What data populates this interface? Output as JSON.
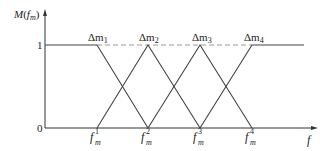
{
  "diagram": {
    "type": "membership-functions",
    "y_axis_label": {
      "main": "M(",
      "var": "f",
      "sub": "m",
      "close": ")"
    },
    "x_axis_label": "f",
    "y_ticks": [
      "1",
      "0"
    ],
    "peaks": [
      {
        "label": "Δm",
        "sub": "1",
        "x_label": "f",
        "x_sub": "m",
        "x_sup": "1"
      },
      {
        "label": "Δm",
        "sub": "2",
        "x_label": "f",
        "x_sub": "m",
        "x_sup": "2"
      },
      {
        "label": "Δm",
        "sub": "3",
        "x_label": "f",
        "x_sub": "m",
        "x_sup": "3"
      },
      {
        "label": "Δm",
        "sub": "4",
        "x_label": "f",
        "x_sub": "m",
        "x_sup": "4"
      }
    ],
    "line_color": "#444444",
    "dashed_color": "#999999"
  }
}
